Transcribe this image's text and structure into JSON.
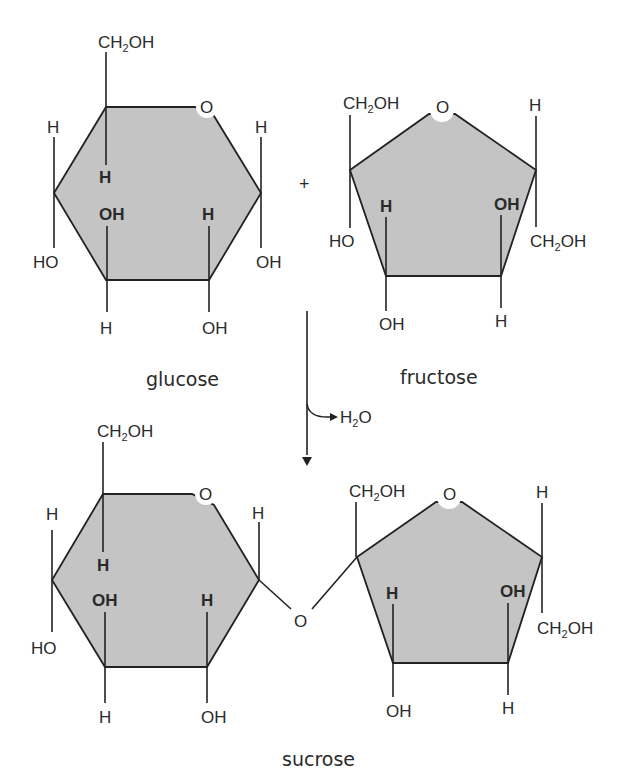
{
  "diagram": {
    "operator": "+",
    "reaction": {
      "byproduct": "H",
      "byproduct_sub": "2",
      "byproduct_tail": "O",
      "arrow": "down-arrow"
    },
    "colors": {
      "ring_fill": "#c4c4c4",
      "line": "#222222",
      "text": "#2a2a2a"
    },
    "glucose": {
      "caption": "glucose",
      "ring_oxygen": "O",
      "labels": {
        "c6_group": "CH",
        "c6_sub": "2",
        "c6_tail": "OH",
        "c5_h": "H",
        "c4_h": "H",
        "c4_oh": "HO",
        "c3_oh": "OH",
        "c3_h": "H",
        "c2_h": "H",
        "c2_oh": "OH",
        "c1_h": "H",
        "c1_oh": "OH"
      }
    },
    "fructose": {
      "caption": "fructose",
      "ring_oxygen": "O",
      "labels": {
        "c2_group": "CH",
        "c2_sub": "2",
        "c2_tail": "OH",
        "c2_oh": "HO",
        "c3_h": "H",
        "c3_oh": "OH",
        "c4_oh": "OH",
        "c4_h": "H",
        "c5_h": "H",
        "c5_group": "CH",
        "c5_sub": "2",
        "c5_tail": "OH"
      }
    },
    "sucrose": {
      "caption": "sucrose",
      "glycosidic_oxygen": "O",
      "glucose_ring_oxygen": "O",
      "fructose_ring_oxygen": "O",
      "labels": {
        "g_c6_group": "CH",
        "g_c6_sub": "2",
        "g_c6_tail": "OH",
        "g_c5_h": "H",
        "g_c4_h": "H",
        "g_c4_oh": "HO",
        "g_c3_oh": "OH",
        "g_c3_h": "H",
        "g_c2_h": "H",
        "g_c2_oh": "OH",
        "g_c1_h": "H",
        "f_c2_group": "CH",
        "f_c2_sub": "2",
        "f_c2_tail": "OH",
        "f_c3_h": "H",
        "f_c3_oh": "OH",
        "f_c4_oh": "OH",
        "f_c4_h": "H",
        "f_c5_h": "H",
        "f_c5_group": "CH",
        "f_c5_sub": "2",
        "f_c5_tail": "OH"
      }
    }
  }
}
